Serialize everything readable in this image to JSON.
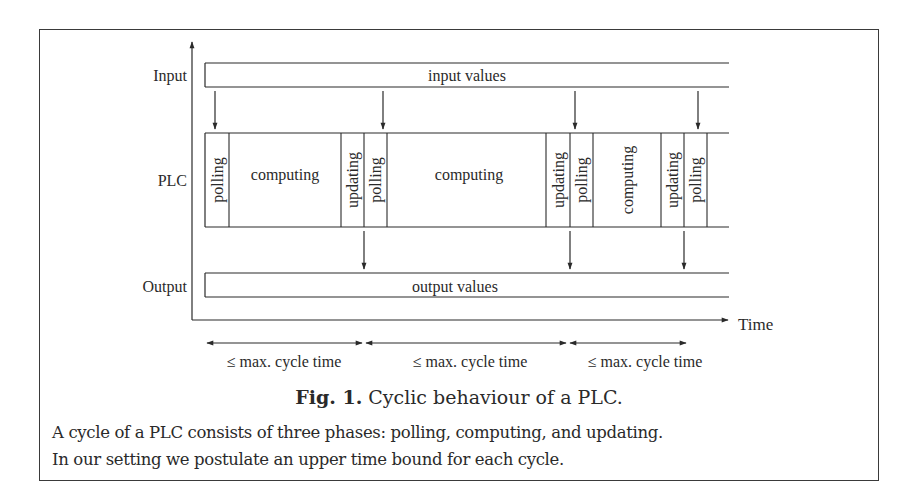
{
  "figure": {
    "caption_label": "Fig. 1.",
    "caption_text": " Cyclic behaviour of a PLC.",
    "description_lines": [
      "A cycle of a PLC consists of three phases: polling, computing, and updating.",
      "In our setting we postulate an upper time bound for each cycle."
    ]
  },
  "axes": {
    "x_label": "Time",
    "rows": [
      "Input",
      "PLC",
      "Output"
    ]
  },
  "bars": {
    "input": "input values",
    "output": "output values"
  },
  "plc_phases": [
    {
      "label": "polling",
      "orientation": "vertical",
      "x0": 205,
      "x1": 229
    },
    {
      "label": "computing",
      "orientation": "horizontal",
      "x0": 229,
      "x1": 341
    },
    {
      "label": "updating",
      "orientation": "vertical",
      "x0": 341,
      "x1": 364
    },
    {
      "label": "polling",
      "orientation": "vertical",
      "x0": 364,
      "x1": 387
    },
    {
      "label": "computing",
      "orientation": "horizontal",
      "x0": 387,
      "x1": 546
    },
    {
      "label": "updating",
      "orientation": "vertical",
      "x0": 546,
      "x1": 570
    },
    {
      "label": "polling",
      "orientation": "vertical",
      "x0": 570,
      "x1": 593
    },
    {
      "label": "computing",
      "orientation": "vertical",
      "x0": 593,
      "x1": 661
    },
    {
      "label": "updating",
      "orientation": "vertical",
      "x0": 661,
      "x1": 684
    },
    {
      "label": "polling",
      "orientation": "vertical",
      "x0": 684,
      "x1": 707
    }
  ],
  "input_arrows_x": [
    215,
    383,
    575,
    698
  ],
  "output_arrows_x": [
    364,
    570,
    684
  ],
  "cycles": [
    {
      "label": "≤ max. cycle time",
      "x0": 207,
      "x1": 362
    },
    {
      "label": "≤ max. cycle time",
      "x0": 366,
      "x1": 566
    },
    {
      "label": "≤ max. cycle time",
      "x0": 570,
      "x1": 686
    }
  ]
}
